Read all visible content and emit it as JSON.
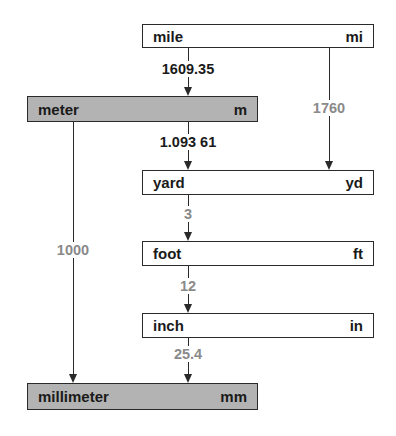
{
  "colors": {
    "metric_fill": "#b3b3b3",
    "imperial_fill": "#ffffff",
    "line": "#2a2a2a",
    "factor_exact": "#8a8a8a",
    "factor_approx": "#1a1a1a"
  },
  "units": {
    "mile": {
      "name": "mile",
      "symbol": "mi",
      "system": "imperial"
    },
    "meter": {
      "name": "meter",
      "symbol": "m",
      "system": "metric"
    },
    "yard": {
      "name": "yard",
      "symbol": "yd",
      "system": "imperial"
    },
    "foot": {
      "name": "foot",
      "symbol": "ft",
      "system": "imperial"
    },
    "inch": {
      "name": "inch",
      "symbol": "in",
      "system": "imperial"
    },
    "millimeter": {
      "name": "millimeter",
      "symbol": "mm",
      "system": "metric"
    }
  },
  "conversions": [
    {
      "from": "mile",
      "to": "meter",
      "factor": "1609.35",
      "style": "dark"
    },
    {
      "from": "mile",
      "to": "yard",
      "factor": "1760",
      "style": "gray"
    },
    {
      "from": "meter",
      "to": "yard",
      "factor": "1.093 61",
      "style": "dark"
    },
    {
      "from": "meter",
      "to": "millimeter",
      "factor": "1000",
      "style": "gray"
    },
    {
      "from": "yard",
      "to": "foot",
      "factor": "3",
      "style": "gray"
    },
    {
      "from": "foot",
      "to": "inch",
      "factor": "12",
      "style": "gray"
    },
    {
      "from": "inch",
      "to": "millimeter",
      "factor": "25.4",
      "style": "gray"
    }
  ]
}
